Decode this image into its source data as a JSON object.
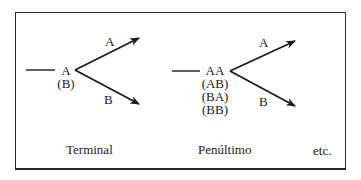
{
  "diagram": {
    "panels": [
      {
        "caption": "Terminal",
        "node_labels": [
          "A",
          "(B)"
        ],
        "branches": [
          {
            "label": "A",
            "direction": "up"
          },
          {
            "label": "B",
            "direction": "down"
          }
        ]
      },
      {
        "caption": "Penúltimo",
        "node_labels": [
          "AA",
          "(AB)",
          "(BA)",
          "(BB)"
        ],
        "branches": [
          {
            "label": "A",
            "direction": "up"
          },
          {
            "label": "B",
            "direction": "down"
          }
        ]
      }
    ],
    "trailing_text": "etc.",
    "colors": {
      "stroke": "#1a1a1a",
      "border": "#2a2a2a",
      "background": "#ffffff"
    }
  }
}
